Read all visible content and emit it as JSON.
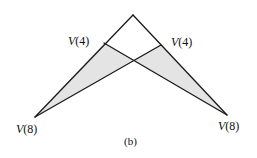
{
  "figure": {
    "caption": "(b)",
    "shade_color": "#e4e4e4",
    "line_color": "#1a1a1a"
  },
  "nodes": {
    "apex": {
      "x": 133,
      "y": 15
    },
    "left_mid": {
      "x": 104,
      "y": 43,
      "label_V": "V",
      "label_arg": "(4)"
    },
    "right_mid": {
      "x": 161,
      "y": 45,
      "label_V": "V",
      "label_arg": "(4)"
    },
    "left_bottom": {
      "x": 35,
      "y": 117,
      "label_V": "V",
      "label_arg": "(8)"
    },
    "right_bottom": {
      "x": 227,
      "y": 115,
      "label_V": "V",
      "label_arg": "(8)"
    },
    "cross": {
      "x": 133,
      "y": 60
    }
  },
  "labels": {
    "left_mid": "V(4)",
    "right_mid": "V(4)",
    "left_bottom": "V(8)",
    "right_bottom": "V(8)"
  }
}
